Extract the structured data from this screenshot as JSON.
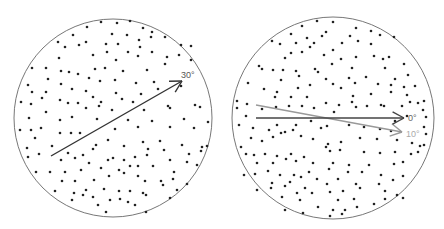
{
  "panels": [
    {
      "id": "left",
      "circle": {
        "cx": 113,
        "cy": 118,
        "r": 99
      },
      "arrows": [
        {
          "x1": 51,
          "y1": 156,
          "x2": 182,
          "y2": 81,
          "color": "#333333",
          "label": "30°",
          "lx": 181,
          "ly": 78,
          "label_color": "#555555"
        }
      ],
      "dots": [
        [
          101,
          22
        ],
        [
          117,
          23
        ],
        [
          130,
          21
        ],
        [
          87,
          27
        ],
        [
          143,
          28
        ],
        [
          152,
          32
        ],
        [
          112,
          34
        ],
        [
          127,
          35
        ],
        [
          73,
          35
        ],
        [
          58,
          42
        ],
        [
          139,
          40
        ],
        [
          151,
          37
        ],
        [
          165,
          37
        ],
        [
          65,
          47
        ],
        [
          79,
          45
        ],
        [
          86,
          42
        ],
        [
          106,
          44
        ],
        [
          118,
          44
        ],
        [
          140,
          47
        ],
        [
          93,
          55
        ],
        [
          107,
          52
        ],
        [
          128,
          52
        ],
        [
          152,
          52
        ],
        [
          181,
          45
        ],
        [
          59,
          58
        ],
        [
          116,
          60
        ],
        [
          138,
          56
        ],
        [
          167,
          57
        ],
        [
          179,
          55
        ],
        [
          191,
          60
        ],
        [
          191,
          46
        ],
        [
          32,
          68
        ],
        [
          46,
          68
        ],
        [
          61,
          71
        ],
        [
          69,
          72
        ],
        [
          78,
          74
        ],
        [
          95,
          69
        ],
        [
          105,
          68
        ],
        [
          123,
          71
        ],
        [
          147,
          70
        ],
        [
          165,
          64
        ],
        [
          89,
          78
        ],
        [
          100,
          81
        ],
        [
          115,
          80
        ],
        [
          136,
          83
        ],
        [
          154,
          82
        ],
        [
          28,
          85
        ],
        [
          48,
          79
        ],
        [
          61,
          84
        ],
        [
          72,
          89
        ],
        [
          86,
          91
        ],
        [
          116,
          93
        ],
        [
          141,
          94
        ],
        [
          158,
          89
        ],
        [
          181,
          86
        ],
        [
          32,
          92
        ],
        [
          46,
          92
        ],
        [
          42,
          98
        ],
        [
          60,
          100
        ],
        [
          68,
          103
        ],
        [
          78,
          103
        ],
        [
          93,
          97
        ],
        [
          101,
          102
        ],
        [
          122,
          99
        ],
        [
          133,
          102
        ],
        [
          168,
          106
        ],
        [
          195,
          105
        ],
        [
          21,
          102
        ],
        [
          31,
          104
        ],
        [
          46,
          112
        ],
        [
          86,
          108
        ],
        [
          99,
          106
        ],
        [
          112,
          110
        ],
        [
          144,
          110
        ],
        [
          170,
          108
        ],
        [
          200,
          107
        ],
        [
          29,
          118
        ],
        [
          60,
          120
        ],
        [
          72,
          117
        ],
        [
          97,
          119
        ],
        [
          128,
          120
        ],
        [
          152,
          121
        ],
        [
          184,
          119
        ],
        [
          208,
          122
        ],
        [
          20,
          130
        ],
        [
          31,
          130
        ],
        [
          41,
          128
        ],
        [
          60,
          133
        ],
        [
          71,
          133
        ],
        [
          80,
          133
        ],
        [
          115,
          129
        ],
        [
          138,
          127
        ],
        [
          170,
          127
        ],
        [
          194,
          128
        ],
        [
          35,
          138
        ],
        [
          52,
          146
        ],
        [
          96,
          145
        ],
        [
          108,
          140
        ],
        [
          124,
          146
        ],
        [
          143,
          142
        ],
        [
          160,
          141
        ],
        [
          182,
          145
        ],
        [
          202,
          147
        ],
        [
          207,
          146
        ],
        [
          27,
          148
        ],
        [
          39,
          154
        ],
        [
          68,
          153
        ],
        [
          83,
          155
        ],
        [
          93,
          149
        ],
        [
          113,
          158
        ],
        [
          135,
          157
        ],
        [
          148,
          149
        ],
        [
          164,
          150
        ],
        [
          189,
          154
        ],
        [
          201,
          151
        ],
        [
          28,
          157
        ],
        [
          61,
          160
        ],
        [
          75,
          158
        ],
        [
          89,
          163
        ],
        [
          108,
          160
        ],
        [
          124,
          160
        ],
        [
          147,
          155
        ],
        [
          138,
          166
        ],
        [
          170,
          160
        ],
        [
          187,
          162
        ],
        [
          36,
          172
        ],
        [
          50,
          172
        ],
        [
          65,
          172
        ],
        [
          81,
          170
        ],
        [
          101,
          168
        ],
        [
          119,
          170
        ],
        [
          130,
          166
        ],
        [
          153,
          166
        ],
        [
          174,
          172
        ],
        [
          197,
          165
        ],
        [
          62,
          181
        ],
        [
          75,
          181
        ],
        [
          94,
          180
        ],
        [
          109,
          176
        ],
        [
          124,
          173
        ],
        [
          138,
          176
        ],
        [
          145,
          181
        ],
        [
          161,
          181
        ],
        [
          173,
          179
        ],
        [
          187,
          184
        ],
        [
          55,
          191
        ],
        [
          74,
          193
        ],
        [
          86,
          190
        ],
        [
          104,
          189
        ],
        [
          119,
          191
        ],
        [
          130,
          191
        ],
        [
          143,
          193
        ],
        [
          163,
          185
        ],
        [
          177,
          190
        ],
        [
          93,
          197
        ],
        [
          83,
          195
        ],
        [
          110,
          200
        ],
        [
          120,
          199
        ],
        [
          128,
          202
        ],
        [
          146,
          195
        ],
        [
          106,
          212
        ],
        [
          135,
          205
        ],
        [
          98,
          205
        ],
        [
          146,
          212
        ],
        [
          72,
          200
        ],
        [
          170,
          198
        ]
      ]
    },
    {
      "id": "right",
      "circle": {
        "cx": 333,
        "cy": 118,
        "r": 101
      },
      "arrows": [
        {
          "x1": 256,
          "y1": 105,
          "x2": 402,
          "y2": 132,
          "color": "#999999",
          "label": "10°",
          "lx": 406,
          "ly": 137,
          "label_color": "#aaaaaa"
        },
        {
          "x1": 256,
          "y1": 118,
          "x2": 404,
          "y2": 118,
          "color": "#444444",
          "label": "0°",
          "lx": 408,
          "ly": 121,
          "label_color": "#666666"
        }
      ],
      "dots": [
        [
          317,
          21
        ],
        [
          333,
          22
        ],
        [
          302,
          26
        ],
        [
          356,
          28
        ],
        [
          371,
          31
        ],
        [
          326,
          32
        ],
        [
          291,
          34
        ],
        [
          307,
          38
        ],
        [
          322,
          36
        ],
        [
          350,
          36
        ],
        [
          380,
          35
        ],
        [
          394,
          37
        ],
        [
          371,
          44
        ],
        [
          272,
          41
        ],
        [
          280,
          44
        ],
        [
          296,
          43
        ],
        [
          314,
          43
        ],
        [
          342,
          43
        ],
        [
          358,
          41
        ],
        [
          356,
          57
        ],
        [
          310,
          47
        ],
        [
          333,
          50
        ],
        [
          291,
          53
        ],
        [
          302,
          52
        ],
        [
          324,
          55
        ],
        [
          341,
          59
        ],
        [
          285,
          58
        ],
        [
          374,
          56
        ],
        [
          389,
          57
        ],
        [
          385,
          68
        ],
        [
          408,
          75
        ],
        [
          259,
          66
        ],
        [
          262,
          69
        ],
        [
          296,
          71
        ],
        [
          318,
          72
        ],
        [
          332,
          64
        ],
        [
          352,
          68
        ],
        [
          383,
          59
        ],
        [
          404,
          64
        ],
        [
          273,
          70
        ],
        [
          283,
          70
        ],
        [
          315,
          69
        ],
        [
          326,
          79
        ],
        [
          349,
          78
        ],
        [
          366,
          77
        ],
        [
          395,
          79
        ],
        [
          281,
          80
        ],
        [
          299,
          76
        ],
        [
          310,
          85
        ],
        [
          333,
          84
        ],
        [
          355,
          83
        ],
        [
          378,
          84
        ],
        [
          391,
          85
        ],
        [
          404,
          87
        ],
        [
          415,
          86
        ],
        [
          248,
          83
        ],
        [
          264,
          89
        ],
        [
          277,
          92
        ],
        [
          298,
          88
        ],
        [
          341,
          88
        ],
        [
          353,
          96
        ],
        [
          371,
          94
        ],
        [
          391,
          92
        ],
        [
          407,
          95
        ],
        [
          237,
          101
        ],
        [
          247,
          104
        ],
        [
          275,
          97
        ],
        [
          291,
          97
        ],
        [
          307,
          97
        ],
        [
          326,
          103
        ],
        [
          339,
          105
        ],
        [
          352,
          102
        ],
        [
          367,
          106
        ],
        [
          384,
          106
        ],
        [
          410,
          102
        ],
        [
          424,
          101
        ],
        [
          237,
          108
        ],
        [
          262,
          109
        ],
        [
          276,
          107
        ],
        [
          289,
          106
        ],
        [
          302,
          106
        ],
        [
          314,
          108
        ],
        [
          334,
          112
        ],
        [
          356,
          107
        ],
        [
          381,
          105
        ],
        [
          402,
          106
        ],
        [
          418,
          103
        ],
        [
          423,
          110
        ],
        [
          407,
          116
        ],
        [
          246,
          116
        ],
        [
          277,
          125
        ],
        [
          296,
          125
        ],
        [
          311,
          121
        ],
        [
          327,
          126
        ],
        [
          349,
          125
        ],
        [
          364,
          127
        ],
        [
          395,
          121
        ],
        [
          426,
          117
        ],
        [
          424,
          127
        ],
        [
          239,
          125
        ],
        [
          253,
          128
        ],
        [
          269,
          130
        ],
        [
          285,
          132
        ],
        [
          293,
          130
        ],
        [
          321,
          128
        ],
        [
          380,
          129
        ],
        [
          391,
          131
        ],
        [
          426,
          134
        ],
        [
          251,
          138
        ],
        [
          262,
          141
        ],
        [
          273,
          137
        ],
        [
          281,
          133
        ],
        [
          301,
          136
        ],
        [
          313,
          139
        ],
        [
          328,
          144
        ],
        [
          341,
          142
        ],
        [
          360,
          138
        ],
        [
          377,
          139
        ],
        [
          397,
          140
        ],
        [
          412,
          143
        ],
        [
          420,
          146
        ],
        [
          424,
          145
        ],
        [
          241,
          147
        ],
        [
          246,
          154
        ],
        [
          254,
          155
        ],
        [
          265,
          154
        ],
        [
          277,
          156
        ],
        [
          291,
          154
        ],
        [
          304,
          157
        ],
        [
          326,
          147
        ],
        [
          330,
          151
        ],
        [
          340,
          150
        ],
        [
          364,
          152
        ],
        [
          380,
          153
        ],
        [
          395,
          152
        ],
        [
          411,
          154
        ],
        [
          418,
          152
        ],
        [
          257,
          163
        ],
        [
          273,
          163
        ],
        [
          286,
          159
        ],
        [
          296,
          161
        ],
        [
          313,
          163
        ],
        [
          333,
          163
        ],
        [
          349,
          165
        ],
        [
          369,
          165
        ],
        [
          394,
          164
        ],
        [
          403,
          162
        ],
        [
          244,
          175
        ],
        [
          255,
          174
        ],
        [
          268,
          171
        ],
        [
          280,
          175
        ],
        [
          294,
          175
        ],
        [
          309,
          172
        ],
        [
          329,
          169
        ],
        [
          348,
          172
        ],
        [
          362,
          172
        ],
        [
          381,
          175
        ],
        [
          403,
          176
        ],
        [
          272,
          183
        ],
        [
          290,
          182
        ],
        [
          301,
          177
        ],
        [
          317,
          179
        ],
        [
          327,
          184
        ],
        [
          338,
          179
        ],
        [
          356,
          184
        ],
        [
          379,
          184
        ],
        [
          393,
          180
        ],
        [
          257,
          190
        ],
        [
          271,
          188
        ],
        [
          285,
          186
        ],
        [
          305,
          188
        ],
        [
          330,
          192
        ],
        [
          343,
          191
        ],
        [
          360,
          188
        ],
        [
          385,
          191
        ],
        [
          397,
          195
        ],
        [
          282,
          197
        ],
        [
          297,
          193
        ],
        [
          312,
          193
        ],
        [
          338,
          200
        ],
        [
          354,
          199
        ],
        [
          385,
          199
        ],
        [
          403,
          198
        ],
        [
          300,
          200
        ],
        [
          318,
          207
        ],
        [
          333,
          210
        ],
        [
          345,
          210
        ],
        [
          357,
          207
        ],
        [
          374,
          204
        ],
        [
          285,
          210
        ],
        [
          303,
          213
        ],
        [
          330,
          216
        ],
        [
          342,
          214
        ]
      ]
    }
  ],
  "stray_marks": [
    [
      31,
      213
    ]
  ]
}
